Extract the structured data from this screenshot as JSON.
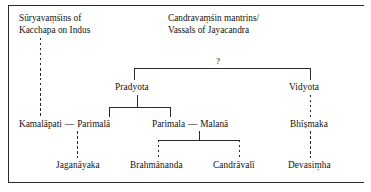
{
  "diagram": {
    "line_color": "#2b2b2b",
    "background": "#ffffff"
  },
  "headings": [
    {
      "line1": "Sūryavaṃśins of",
      "line2": "Kacchapa on Indus"
    },
    {
      "line1": "Candravaṃśin mantrins/",
      "line2": "Vassals of Jayacandra"
    }
  ],
  "uncertain_marker": "?",
  "nodes": {
    "pradyota": "Pradyota",
    "vidyota": "Vidyota",
    "kamalapati": "Kamalāpati",
    "parimala_f": "Parimalā",
    "parimala_m": "Parimala",
    "malana": "Malanā",
    "bhismaka": "Bhīṣmaka",
    "jaganayaka": "Jaganāyaka",
    "brahmananda": "Brahmānanda",
    "candravali": "Candrāvalī",
    "devasimha": "Devasiṃha"
  },
  "marriage_dash": "—"
}
